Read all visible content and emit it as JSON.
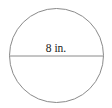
{
  "diagram": {
    "shape": "circle",
    "center": {
      "x": 56.5,
      "y": 55.5
    },
    "radius": 47,
    "stroke_color": "#8a8a8a",
    "diameter": {
      "y": 56,
      "x1": 9.5,
      "x2": 103.5,
      "stroke_color": "#8a8a8a"
    },
    "label": {
      "text": "8 in.",
      "x": 56,
      "y": 52
    }
  }
}
